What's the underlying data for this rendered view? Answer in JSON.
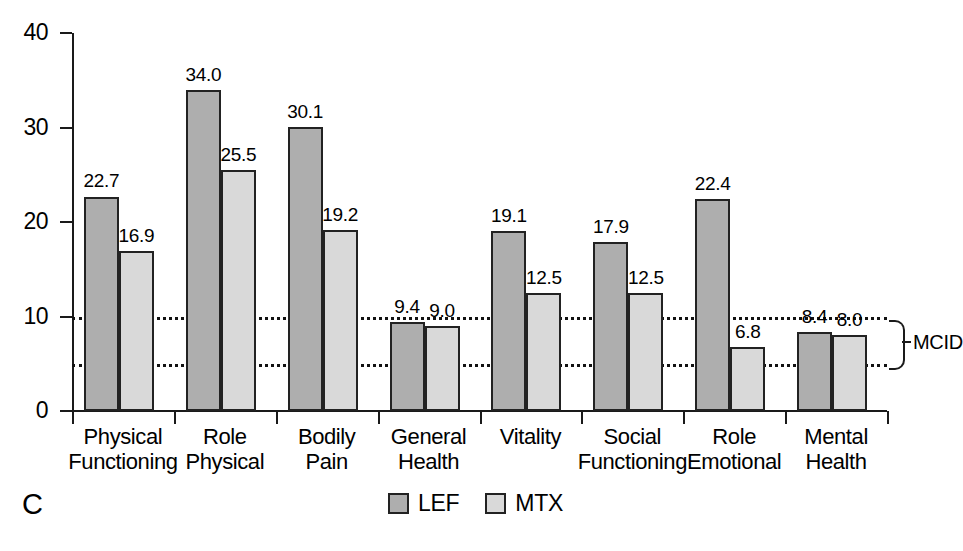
{
  "panel_letter": "C",
  "chart_data": {
    "type": "bar",
    "title": "",
    "xlabel": "",
    "ylabel": "",
    "ylim": [
      0,
      40
    ],
    "yticks": [
      0,
      10,
      20,
      30,
      40
    ],
    "ytick_labels": [
      "0",
      "10",
      "20",
      "30",
      "40"
    ],
    "grid": false,
    "legend_position": "bottom-center",
    "categories": [
      "Physical\nFunctioning",
      "Role\nPhysical",
      "Bodily\nPain",
      "General\nHealth",
      "Vitality",
      "Social\nFunctioning",
      "Role\nEmotional",
      "Mental\nHealth"
    ],
    "category_lines": [
      [
        "Physical",
        "Functioning"
      ],
      [
        "Role",
        "Physical"
      ],
      [
        "Bodily",
        "Pain"
      ],
      [
        "General",
        "Health"
      ],
      [
        "Vitality",
        ""
      ],
      [
        "Social",
        "Functioning"
      ],
      [
        "Role",
        "Emotional"
      ],
      [
        "Mental",
        "Health"
      ]
    ],
    "series": [
      {
        "name": "LEF",
        "color": "#aeaeae",
        "values": [
          22.7,
          34.0,
          30.1,
          9.4,
          19.1,
          17.9,
          22.4,
          8.4
        ],
        "labels": [
          "22.7",
          "34.0",
          "30.1",
          "9.4",
          "19.1",
          "17.9",
          "22.4",
          "8.4"
        ]
      },
      {
        "name": "MTX",
        "color": "#d9d9d9",
        "values": [
          16.9,
          25.5,
          19.2,
          9.0,
          12.5,
          12.5,
          6.8,
          8.0
        ],
        "labels": [
          "16.9",
          "25.5",
          "19.2",
          "9.0",
          "12.5",
          "12.5",
          "6.8",
          "8.0"
        ]
      }
    ],
    "reference_lines": [
      {
        "value": 10,
        "style": "dotted",
        "label": ""
      },
      {
        "value": 5,
        "style": "dotted",
        "label": ""
      }
    ],
    "annotations": [
      {
        "text": "MCID",
        "from_value": 10,
        "to_value": 5,
        "position": "right"
      }
    ]
  },
  "legend": {
    "items": [
      {
        "label": "LEF",
        "color": "#aeaeae"
      },
      {
        "label": "MTX",
        "color": "#d9d9d9"
      }
    ]
  },
  "mcid": {
    "label": "MCID"
  }
}
